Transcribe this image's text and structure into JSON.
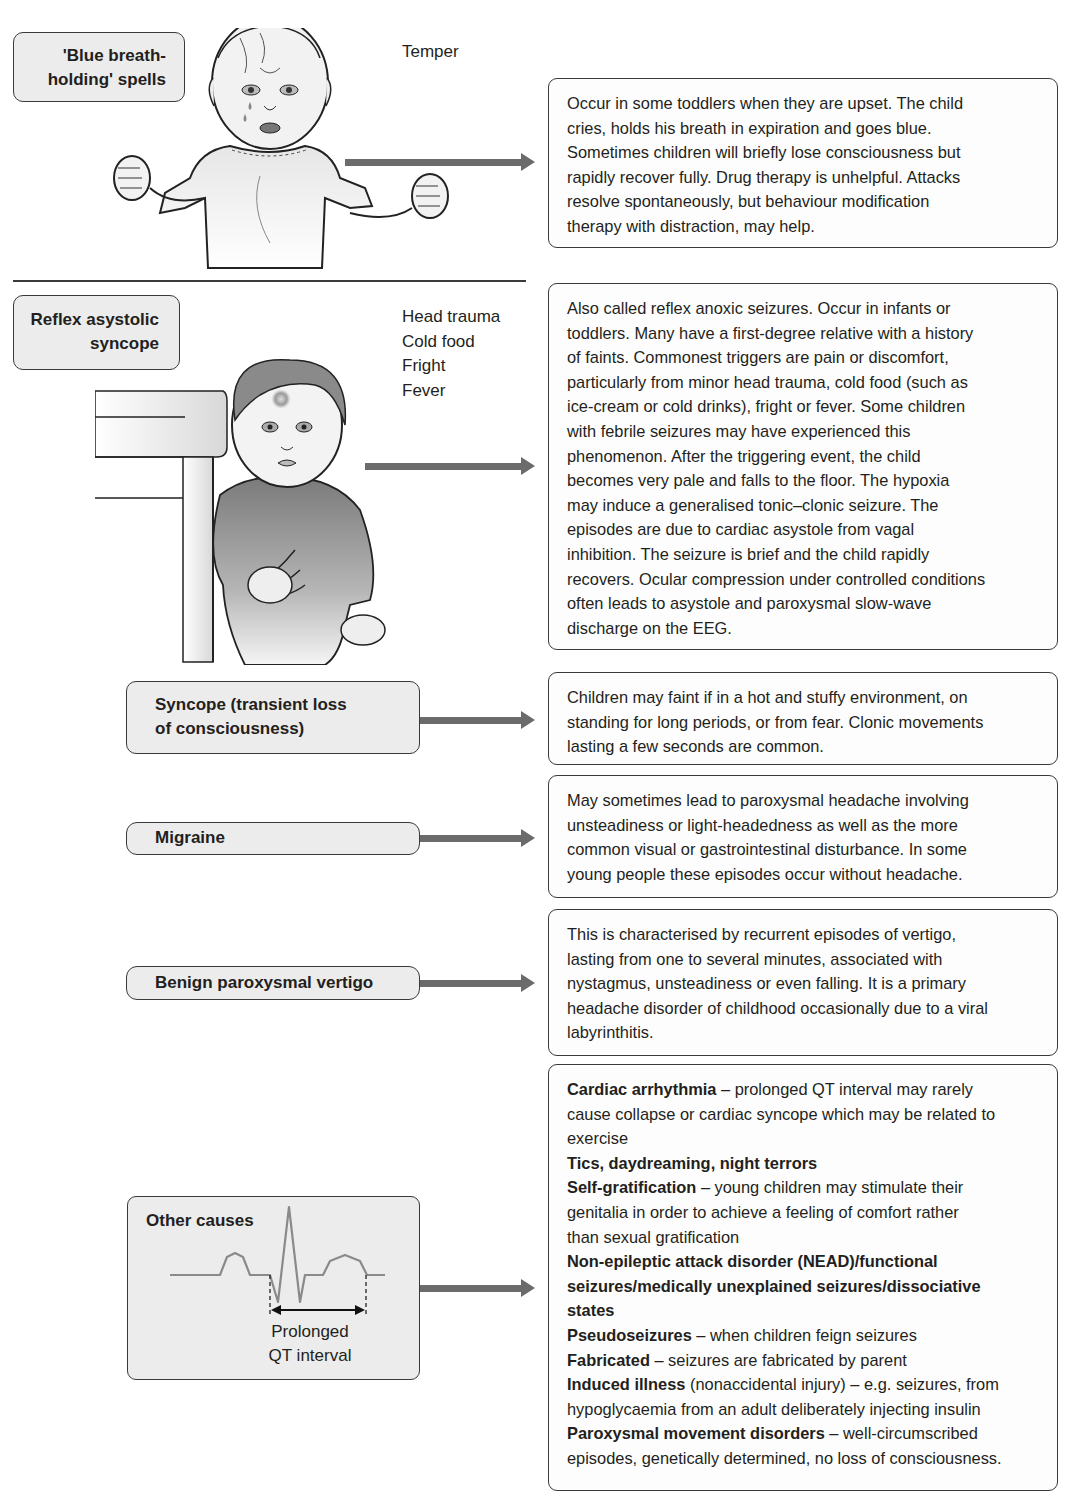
{
  "sections": {
    "breath_holding": {
      "label": "'Blue breath-holding' spells",
      "label_lines": [
        "'Blue breath-",
        "holding' spells"
      ],
      "trigger": "Temper",
      "illustration": "crying-toddler-with-clenched-fists",
      "description_lines": [
        "Occur in some toddlers when they are upset.  The child",
        "cries, holds his breath in expiration and goes blue.",
        "Sometimes children will  briefly lose consciousness but",
        "rapidly recover fully.  Drug therapy is unhelpful.  Attacks",
        "resolve spontaneously, but behaviour modification",
        "therapy with distraction, may help."
      ]
    },
    "reflex_asystolic": {
      "label": "Reflex asystolic syncope",
      "label_lines": [
        "Reflex  asystolic",
        "syncope"
      ],
      "triggers": [
        "Head trauma",
        "Cold food",
        "Fright",
        "Fever"
      ],
      "illustration": "pale-toddler-by-table-with-bruised-forehead",
      "description_lines": [
        "Also called reflex anoxic seizures.  Occur in infants or",
        "toddlers.  Many have a first-degree relative with a history",
        "of faints. Commonest triggers are pain or discomfort,",
        "particularly from minor head trauma,  cold food (such as",
        "ice-cream or cold drinks), fright or fever.  Some children",
        "with febrile seizures may have experienced this",
        "phenomenon. After the triggering event, the child",
        "becomes very pale and falls to the floor.  The hypoxia",
        "may induce a generalised tonic–clonic seizure. The",
        "episodes are due to cardiac asystole from vagal",
        "inhibition. The seizure is brief and the child rapidly",
        "recovers. Ocular compression under controlled conditions",
        "often leads to asystole and paroxysmal slow-wave",
        "discharge on the EEG."
      ]
    },
    "syncope": {
      "label": "Syncope (transient loss of consciousness)",
      "label_lines": [
        "Syncope (transient loss",
        "of consciousness)"
      ],
      "description_lines": [
        "Children may faint if in a hot and stuffy environment, on",
        "standing for long periods, or from fear. Clonic movements",
        "lasting a few seconds are common."
      ]
    },
    "migraine": {
      "label": "Migraine",
      "description_lines": [
        "May sometimes lead to paroxysmal headache involving",
        "unsteadiness or light-headedness as well as the more",
        "common visual or gastrointestinal disturbance. In some",
        "young people these episodes occur without headache."
      ]
    },
    "vertigo": {
      "label": "Benign paroxysmal vertigo",
      "description_lines": [
        "This is characterised by recurrent episodes of vertigo,",
        "lasting from one to several minutes, associated with",
        "nystagmus, unsteadiness or even falling. It is a primary",
        "headache disorder of childhood occasionally due to a viral",
        "labyrinthitis."
      ]
    },
    "other": {
      "label": "Other causes",
      "ecg_caption_lines": [
        "Prolonged",
        "QT interval"
      ],
      "items": [
        {
          "term": "Cardiac arrhythmia",
          "text": " – prolonged QT interval may rarely"
        },
        {
          "term": "",
          "text": "cause collapse or cardiac syncope which may be related to"
        },
        {
          "term": "",
          "text": "exercise"
        },
        {
          "term": "Tics, daydreaming, night terrors",
          "text": ""
        },
        {
          "term": "Self-gratification",
          "text": " – young children may stimulate their"
        },
        {
          "term": "",
          "text": "genitalia in order to achieve a feeling of comfort rather"
        },
        {
          "term": "",
          "text": "than sexual gratification"
        },
        {
          "term": "Non-epileptic attack disorder (NEAD)/functional",
          "text": ""
        },
        {
          "term": "seizures/medically unexplained seizures/dissociative",
          "text": ""
        },
        {
          "term": "states",
          "text": ""
        },
        {
          "term": "Pseudoseizures",
          "text": " – when children feign seizures"
        },
        {
          "term": "Fabricated",
          "text": " – seizures are fabricated by parent"
        },
        {
          "term": "Induced illness",
          "text": " (nonaccidental injury) – e.g. seizures, from"
        },
        {
          "term": "",
          "text": "hypoglycaemia from an adult deliberately injecting insulin"
        },
        {
          "term": "Paroxysmal movement disorders",
          "text": " – well-circumscribed"
        },
        {
          "term": "",
          "text": "episodes, genetically determined, no loss of consciousness."
        }
      ]
    }
  },
  "colors": {
    "label_fill": "#ececec",
    "border": "#3a3a3a",
    "arrow": "#6b6b6b",
    "ecg_trace": "#8a8a8a",
    "text": "#231f20"
  }
}
